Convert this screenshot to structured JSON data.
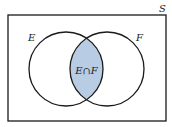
{
  "diagram": {
    "type": "venn",
    "universe_label": "S",
    "sets": [
      {
        "label": "E"
      },
      {
        "label": "F"
      }
    ],
    "intersection_label": "E∩F",
    "colors": {
      "intersection_fill": "#b8cce4",
      "stroke": "#1a1a1a",
      "background": "#ffffff"
    }
  }
}
